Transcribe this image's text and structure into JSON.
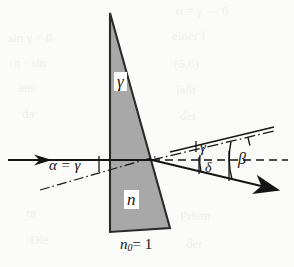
{
  "figure": {
    "kind": "optics-ray-diagram",
    "background_color": "#fbfbfa",
    "ink_color": "#151515",
    "prism_fill_color": "#a8a8a8",
    "prism_stroke_color": "#2a2a2a"
  },
  "labels": {
    "apex_angle": "γ",
    "prism_index": "n",
    "ambient_index_symbol": "n",
    "ambient_index_subscript": "0",
    "ambient_index_value": "= 1",
    "incidence": "α = γ",
    "exit_gamma": "γ",
    "deviation": "δ",
    "refraction_beta": "β"
  },
  "geometry": {
    "prism": {
      "apex": [
        110,
        13
      ],
      "bottom_left": [
        110,
        232
      ],
      "bottom_right": [
        170,
        228
      ]
    },
    "optical_axis_y": 160,
    "incident_ray": {
      "from": [
        8,
        160
      ],
      "to": [
        152,
        160
      ]
    },
    "exit_point": [
      152,
      160
    ],
    "outgoing_ray": {
      "from": [
        152,
        160
      ],
      "to": [
        283,
        191
      ]
    },
    "beta_dashed_axis": {
      "from": [
        152,
        160
      ],
      "to": [
        288,
        160
      ]
    },
    "upper_dashdot_ray": {
      "from": [
        152,
        160
      ],
      "to": [
        272,
        131
      ]
    },
    "lower_dashdot_normal": {
      "from": [
        40,
        190
      ],
      "to": [
        155,
        157
      ]
    },
    "arc_gamma": {
      "center": [
        152,
        160
      ],
      "radius": 98
    },
    "arc_beta": {
      "center": [
        152,
        160
      ],
      "radius": 80
    },
    "arc_delta": {
      "center": [
        152,
        160
      ],
      "radius": 55
    },
    "tick_alpha_x": 100
  },
  "bleed_through": [
    {
      "text": "α = γ — 0",
      "x": 176,
      "y": 3
    },
    {
      "text": "sin γ = 0",
      "x": 8,
      "y": 30
    },
    {
      "text": "einer f",
      "x": 172,
      "y": 28
    },
    {
      "text": "n · sin",
      "x": 14,
      "y": 55
    },
    {
      "text": "(5.6)",
      "x": 174,
      "y": 56
    },
    {
      "text": "aus",
      "x": 18,
      "y": 80
    },
    {
      "text": "läßt",
      "x": 176,
      "y": 82
    },
    {
      "text": "da",
      "x": 22,
      "y": 106
    },
    {
      "text": "der",
      "x": 180,
      "y": 108
    },
    {
      "text": "m",
      "x": 26,
      "y": 205
    },
    {
      "text": "Prism",
      "x": 180,
      "y": 208
    },
    {
      "text": "Die",
      "x": 30,
      "y": 232
    },
    {
      "text": "der",
      "x": 186,
      "y": 236
    }
  ]
}
